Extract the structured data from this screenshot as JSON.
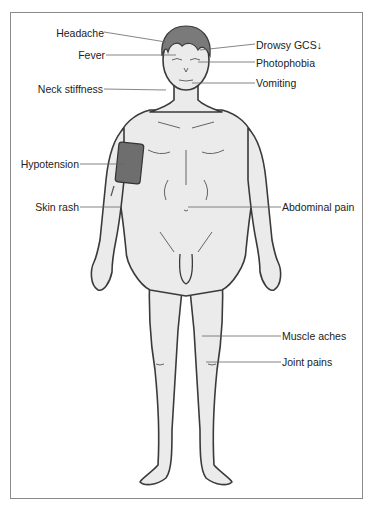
{
  "diagram": {
    "type": "anatomical-symptom-map",
    "colors": {
      "skin": "#ebebeb",
      "outline": "#3a3a3a",
      "hair": "#7a7a7a",
      "cuff": "#6e6e6e",
      "leader_line": "#666666",
      "frame": "#8a8a8a"
    },
    "labels_left": [
      {
        "id": "headache",
        "text": "Headache"
      },
      {
        "id": "fever",
        "text": "Fever"
      },
      {
        "id": "neck-stiffness",
        "text": "Neck stiffness"
      },
      {
        "id": "hypotension",
        "text": "Hypotension"
      },
      {
        "id": "skin-rash",
        "text": "Skin rash"
      }
    ],
    "labels_right": [
      {
        "id": "drowsy-gcs",
        "text": "Drowsy  GCS↓"
      },
      {
        "id": "photophobia",
        "text": "Photophobia"
      },
      {
        "id": "vomiting",
        "text": "Vomiting"
      },
      {
        "id": "abdominal-pain",
        "text": "Abdominal pain"
      },
      {
        "id": "muscle-aches",
        "text": "Muscle aches"
      },
      {
        "id": "joint-pains",
        "text": "Joint pains"
      }
    ]
  }
}
